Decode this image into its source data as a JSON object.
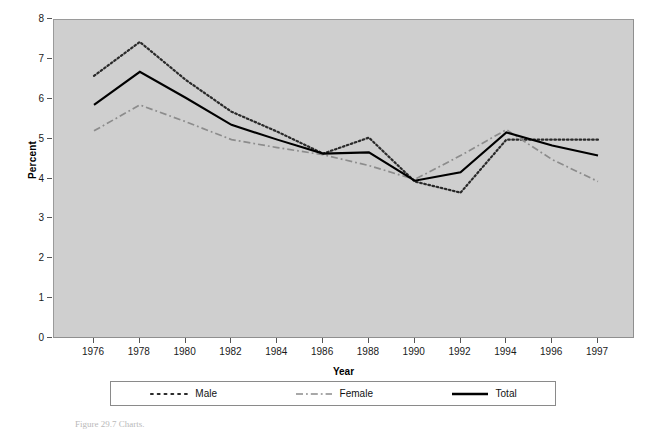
{
  "chart_data": {
    "type": "line",
    "title": "",
    "xlabel": "Year",
    "ylabel": "Percent",
    "ylim": [
      0,
      8
    ],
    "ytick_step": 1,
    "yticks": [
      8,
      7,
      6,
      5,
      4,
      3,
      2,
      1,
      0
    ],
    "grid": false,
    "legend_position": "bottom",
    "plot_background_color": "#cfcfcf",
    "categories": [
      "1976",
      "1978",
      "1980",
      "1982",
      "1984",
      "1986",
      "1988",
      "1990",
      "1992",
      "1994",
      "1996",
      "1997"
    ],
    "series": [
      {
        "name": "Male",
        "style": "dotted",
        "color": "#2a2a2a",
        "values": [
          6.6,
          7.45,
          6.5,
          5.7,
          5.2,
          4.65,
          5.05,
          3.95,
          3.67,
          5.0,
          5.0,
          5.0
        ]
      },
      {
        "name": "Female",
        "style": "dash-dot",
        "color": "#8c8c8c",
        "values": [
          5.22,
          5.87,
          5.45,
          5.0,
          4.8,
          4.62,
          4.35,
          4.0,
          4.6,
          5.25,
          4.5,
          3.95
        ]
      },
      {
        "name": "Total",
        "style": "solid",
        "color": "#000000",
        "values": [
          5.87,
          6.7,
          6.05,
          5.37,
          5.0,
          4.65,
          4.68,
          3.97,
          4.18,
          5.18,
          4.85,
          4.6
        ]
      }
    ]
  },
  "axes": {
    "x_title": "Year",
    "y_title": "Percent"
  },
  "legend": {
    "entries": [
      {
        "label": "Male"
      },
      {
        "label": "Female"
      },
      {
        "label": "Total"
      }
    ]
  },
  "caption": {
    "text": "Figure 29.7   Charts."
  }
}
